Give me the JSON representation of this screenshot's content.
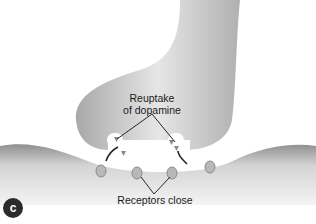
{
  "diagram": {
    "panel_label": "c",
    "labels": {
      "reuptake_line1": "Reuptake",
      "reuptake_line2": "of dopamine",
      "receptors": "Receptors close"
    },
    "colors": {
      "membrane": "#9a9a9a",
      "membrane_light": "#e4e4e4",
      "gap": "#ffffff",
      "receptor": "#b8b8b8",
      "dopamine": "#8a8a8a",
      "text": "#1a1a1a",
      "badge": "#2b2b2b"
    }
  }
}
